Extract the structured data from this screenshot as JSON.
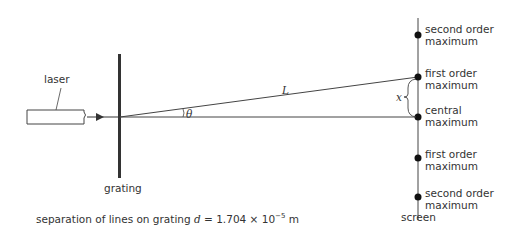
{
  "diagram": {
    "type": "diffraction-grating-setup",
    "labels": {
      "laser": "laser",
      "grating": "grating",
      "screen": "screen",
      "path_length": "L",
      "angle": "θ",
      "separation_x": "x"
    },
    "maxima": [
      {
        "line1": "second order",
        "line2": "maximum"
      },
      {
        "line1": "first order",
        "line2": "maximum"
      },
      {
        "line1": "central",
        "line2": "maximum"
      },
      {
        "line1": "first order",
        "line2": "maximum"
      },
      {
        "line1": "second order",
        "line2": "maximum"
      }
    ],
    "caption": {
      "prefix": "separation of lines on grating ",
      "var": "d",
      "equals": " = 1.704 × 10",
      "exponent": "−5",
      "unit": " m"
    }
  }
}
